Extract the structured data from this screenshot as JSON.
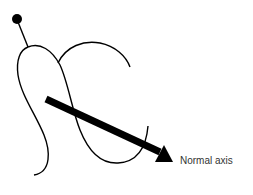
{
  "diagram": {
    "label": "Normal axis",
    "colors": {
      "stroke": "#000000",
      "text": "#333333",
      "background": "#ffffff"
    }
  }
}
